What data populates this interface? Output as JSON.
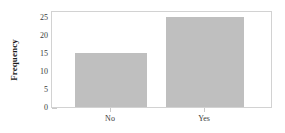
{
  "chart_data": {
    "type": "bar",
    "title": "",
    "xlabel": "",
    "ylabel": "Frequency",
    "categories": [
      "No",
      "Yes"
    ],
    "values": [
      15,
      25
    ],
    "yticks": [
      0,
      5,
      10,
      15,
      20,
      25
    ],
    "ylim": [
      0,
      27
    ],
    "grid": false,
    "legend": false,
    "bar_color": "#bfbfbf",
    "frame_color": "#d2d2d2",
    "background": "#ffffff"
  },
  "axis": {
    "y_title": "Frequency",
    "y_tick_labels": [
      "0",
      "5",
      "10",
      "15",
      "20",
      "25"
    ],
    "x_tick_labels": [
      "No",
      "Yes"
    ]
  }
}
